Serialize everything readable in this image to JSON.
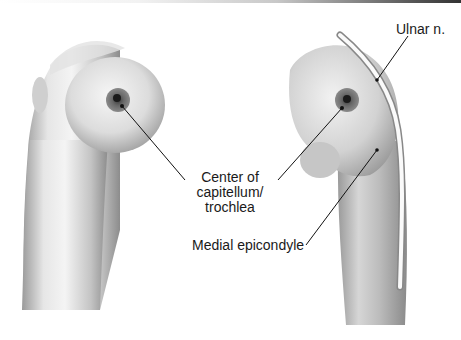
{
  "figure": {
    "left_view": {
      "name": "lateral view of distal humerus"
    },
    "right_view": {
      "name": "medial view of distal humerus"
    }
  },
  "labels": {
    "ulnar_nerve": "Ulnar n.",
    "center_line1": "Center of",
    "center_line2": "capitellum/",
    "center_line3": "trochlea",
    "medial_epicondyle": "Medial epicondyle"
  },
  "colors": {
    "bone_light": "#f0f0f0",
    "bone_mid": "#c9c9c9",
    "bone_dark": "#8a8a8a",
    "target_outer": "#6e6e6e",
    "target_inner": "#222222",
    "leader_line": "#111111",
    "nerve": "#fafafa"
  }
}
